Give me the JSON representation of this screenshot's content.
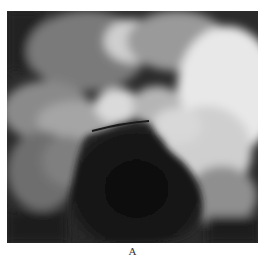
{
  "figure": {
    "caption": "A",
    "image_description": "Grayscale endoscopic view showing bright mucosal folds surrounding a dark central lumen"
  }
}
